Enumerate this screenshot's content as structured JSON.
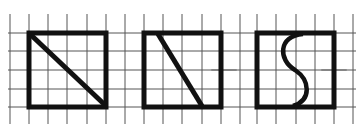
{
  "figure": {
    "grid_color": "#555555",
    "stroke_color": "#111111",
    "squares": [
      {
        "id": "square-1",
        "cells": 4,
        "divider": "diagonal",
        "divider_label": "diagonal from top-left to bottom-right"
      },
      {
        "id": "square-2",
        "cells": 4,
        "divider": "slanted",
        "divider_label": "slanted line from top (0.5 cell) to bottom (3 cells)"
      },
      {
        "id": "square-3",
        "cells": 4,
        "divider": "s-curve",
        "divider_label": "S-shaped curve from top-center to bottom-center"
      }
    ]
  }
}
